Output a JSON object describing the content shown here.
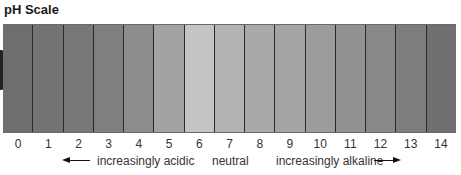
{
  "title": "pH Scale",
  "scale": {
    "ticks": [
      "0",
      "1",
      "2",
      "3",
      "4",
      "5",
      "6",
      "7",
      "8",
      "9",
      "10",
      "11",
      "12",
      "13",
      "14"
    ],
    "segment_colors": [
      "#6e6e6e",
      "#737373",
      "#787878",
      "#7f7f7f",
      "#8c8c8c",
      "#a3a3a3",
      "#c4c4c4",
      "#b3b3b3",
      "#a9a9a9",
      "#a4a4a4",
      "#9c9c9c",
      "#929292",
      "#888888",
      "#7d7d7d",
      "#707070"
    ]
  },
  "annotations": {
    "acidic": "increasingly acidic",
    "neutral": "neutral",
    "alkaline": "increasingly alkaline"
  }
}
